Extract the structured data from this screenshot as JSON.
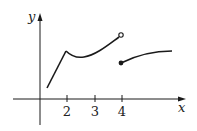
{
  "figure": {
    "type": "piecewise function graph",
    "axes": {
      "x_label": "x",
      "y_label": "y",
      "x_ticks": [
        "2",
        "3",
        "4"
      ]
    },
    "pieces": [
      {
        "description": "line rising from near x=1 to a corner at x=2",
        "endpoints": "left end unmarked"
      },
      {
        "description": "curve dipping after x=2 then rising to x=4",
        "right_endpoint": "open circle at x=4"
      },
      {
        "description": "curve starting at x=4 rising and leveling off",
        "left_endpoint": "filled dot at x=4"
      }
    ],
    "colors": {
      "stroke": "#1a1a1a",
      "background": "#ffffff"
    }
  }
}
